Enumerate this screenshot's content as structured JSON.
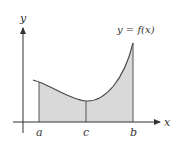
{
  "diagram": {
    "curve_label": "y = f(x)",
    "axes": {
      "x_label": "x",
      "y_label": "y"
    },
    "points": {
      "a": "a",
      "c": "c",
      "b": "b"
    },
    "colors": {
      "fill": "#d9d9d9",
      "stroke": "#444444",
      "axis": "#333333"
    }
  }
}
